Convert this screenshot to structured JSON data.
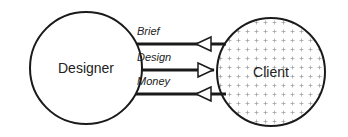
{
  "diagram": {
    "nodes": [
      {
        "id": "designer",
        "label": "Designer",
        "fill": "plain"
      },
      {
        "id": "client",
        "label": "Client",
        "fill": "cross-hatch"
      }
    ],
    "flows": [
      {
        "label": "Brief",
        "direction": "client-to-designer"
      },
      {
        "label": "Design",
        "direction": "designer-to-client"
      },
      {
        "label": "Money",
        "direction": "client-to-designer"
      }
    ],
    "colors": {
      "stroke": "#1a1a1a",
      "pattern": "#9a9a9a",
      "background": "#ffffff"
    }
  }
}
